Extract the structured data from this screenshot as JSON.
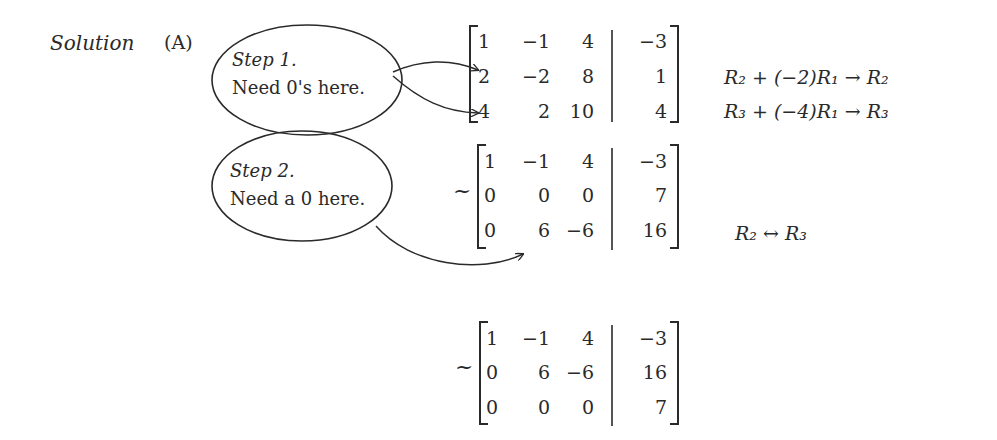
{
  "header": {
    "solution_label": "Solution",
    "part_label": "(A)"
  },
  "step1": {
    "title": "Step 1.",
    "note": "Need 0's here."
  },
  "step2": {
    "title": "Step 2.",
    "note": "Need a 0 here."
  },
  "matrix1": {
    "tilde": "",
    "rows": [
      [
        "1",
        "−1",
        "4",
        "−3"
      ],
      [
        "2",
        "−2",
        "8",
        "1"
      ],
      [
        "4",
        "2",
        "10",
        "4"
      ]
    ],
    "ops": [
      "",
      "R₂ + (−2)R₁ → R₂",
      "R₃ + (−4)R₁ → R₃"
    ]
  },
  "matrix2": {
    "tilde": "~",
    "rows": [
      [
        "1",
        "−1",
        "4",
        "−3"
      ],
      [
        "0",
        "0",
        "0",
        "7"
      ],
      [
        "0",
        "6",
        "−6",
        "16"
      ]
    ],
    "ops": [
      "",
      "",
      "R₂ ↔ R₃"
    ]
  },
  "matrix3": {
    "tilde": "~",
    "rows": [
      [
        "1",
        "−1",
        "4",
        "−3"
      ],
      [
        "0",
        "6",
        "−6",
        "16"
      ],
      [
        "0",
        "0",
        "0",
        "7"
      ]
    ]
  },
  "colors": {
    "ink": "#2a2a2a",
    "background": "#ffffff"
  }
}
